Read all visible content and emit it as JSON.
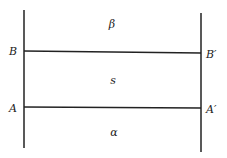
{
  "diagram": {
    "regions": {
      "top": "β",
      "middle": "s",
      "bottom": "α"
    },
    "points": {
      "B_left": "B",
      "B_right": "B′",
      "A_left": "A",
      "A_right": "A′"
    },
    "colors": {
      "line": "#222222",
      "background": "#ffffff"
    }
  }
}
